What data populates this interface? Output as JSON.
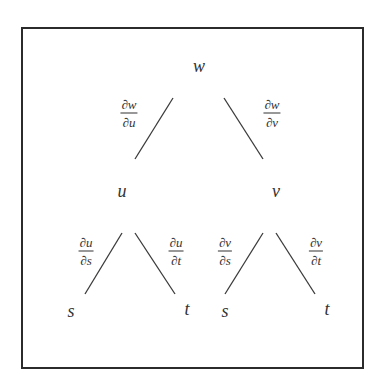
{
  "diagram": {
    "type": "tree",
    "title": "",
    "nodes": {
      "root": {
        "label": "w",
        "x": 199,
        "y": 66
      },
      "u": {
        "label": "u",
        "x": 122,
        "y": 191
      },
      "v": {
        "label": "v",
        "x": 276,
        "y": 191
      },
      "u_s": {
        "label": "s",
        "x": 71,
        "y": 311
      },
      "u_t": {
        "label": "t",
        "x": 187,
        "y": 309
      },
      "v_s": {
        "label": "s",
        "x": 225,
        "y": 311
      },
      "v_t": {
        "label": "t",
        "x": 327,
        "y": 309
      }
    },
    "edges": [
      {
        "from": "root",
        "to": "u",
        "x1": 173,
        "y1": 98,
        "x2": 135,
        "y2": 159,
        "label": {
          "num": "∂w",
          "den": "∂u",
          "x": 129,
          "y": 113
        }
      },
      {
        "from": "root",
        "to": "v",
        "x1": 224,
        "y1": 98,
        "x2": 263,
        "y2": 159,
        "label": {
          "num": "∂w",
          "den": "∂v",
          "x": 272,
          "y": 113
        }
      },
      {
        "from": "u",
        "to": "u_s",
        "x1": 122,
        "y1": 233,
        "x2": 85,
        "y2": 294,
        "label": {
          "num": "∂u",
          "den": "∂s",
          "x": 86,
          "y": 251
        }
      },
      {
        "from": "u",
        "to": "u_t",
        "x1": 135,
        "y1": 233,
        "x2": 175,
        "y2": 294,
        "label": {
          "num": "∂u",
          "den": "∂t",
          "x": 176,
          "y": 251
        }
      },
      {
        "from": "v",
        "to": "v_s",
        "x1": 263,
        "y1": 233,
        "x2": 225,
        "y2": 294,
        "label": {
          "num": "∂v",
          "den": "∂s",
          "x": 225,
          "y": 251
        }
      },
      {
        "from": "v",
        "to": "v_t",
        "x1": 276,
        "y1": 233,
        "x2": 315,
        "y2": 294,
        "label": {
          "num": "∂v",
          "den": "∂t",
          "x": 316,
          "y": 251
        }
      }
    ]
  }
}
